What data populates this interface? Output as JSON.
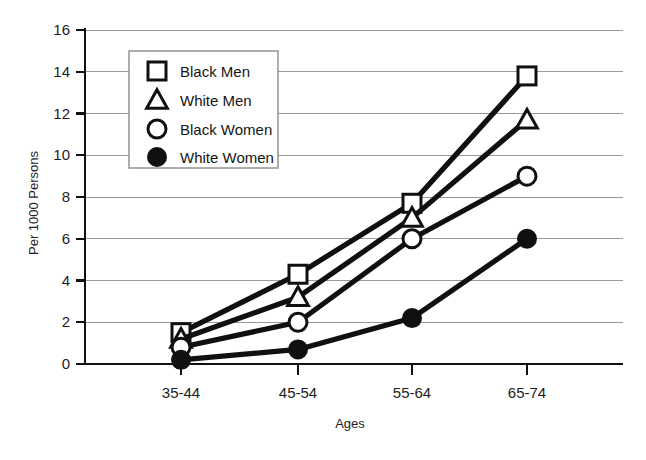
{
  "chart_data": {
    "type": "line",
    "title": "",
    "xlabel": "Ages",
    "ylabel": "Per 1000 Persons",
    "categories": [
      "35-44",
      "45-54",
      "55-64",
      "65-74"
    ],
    "ylim": [
      0,
      16
    ],
    "ytick_labels": [
      "0",
      "2",
      "4",
      "6",
      "8",
      "10",
      "12",
      "14",
      "16"
    ],
    "yticks": [
      0,
      2,
      4,
      6,
      8,
      10,
      12,
      14,
      16
    ],
    "grid": "horizontal",
    "legend_position": "upper-left-inside",
    "series": [
      {
        "name": "Black Men",
        "marker": "open-square",
        "values": [
          1.5,
          4.3,
          7.7,
          13.8
        ]
      },
      {
        "name": "White Men",
        "marker": "open-triangle",
        "values": [
          1.2,
          3.2,
          7.0,
          11.7
        ]
      },
      {
        "name": "Black Women",
        "marker": "open-circle",
        "values": [
          0.8,
          2.0,
          6.0,
          9.0
        ]
      },
      {
        "name": "White Women",
        "marker": "filled-circle",
        "values": [
          0.2,
          0.7,
          2.2,
          6.0
        ]
      }
    ]
  },
  "axis": {
    "y_title": "Per 1000 Persons",
    "x_title": "Ages",
    "y_labels": {
      "t0": "0",
      "t2": "2",
      "t4": "4",
      "t6": "6",
      "t8": "8",
      "t10": "10",
      "t12": "12",
      "t14": "14",
      "t16": "16"
    },
    "x_labels": {
      "c0": "35-44",
      "c1": "45-54",
      "c2": "55-64",
      "c3": "65-74"
    }
  },
  "legend": {
    "items": [
      {
        "label": "Black Men",
        "marker": "open-square"
      },
      {
        "label": "White Men",
        "marker": "open-triangle"
      },
      {
        "label": "Black Women",
        "marker": "open-circle"
      },
      {
        "label": "White Women",
        "marker": "filled-circle"
      }
    ]
  },
  "colors": {
    "ink": "#101010",
    "grid": "#9a9a9a",
    "background": "#ffffff",
    "legend_border": "#8c8c8c"
  }
}
